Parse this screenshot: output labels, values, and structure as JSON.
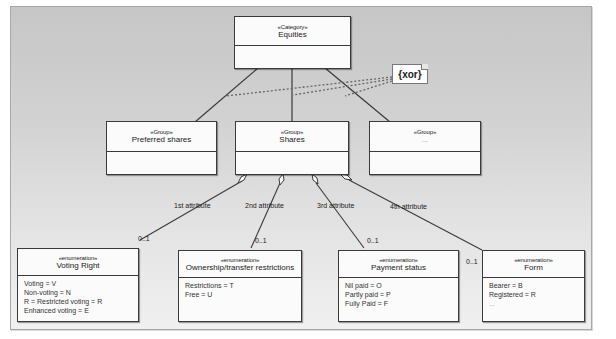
{
  "diagram": {
    "type": "UML class diagram",
    "root": {
      "stereotype": "«Category»",
      "name": "Equities"
    },
    "constraint_note": {
      "text": "{xor}"
    },
    "groups": [
      {
        "stereotype": "«Group»",
        "name": "Preferred shares"
      },
      {
        "stereotype": "«Group»",
        "name": "Shares"
      },
      {
        "stereotype": "«Group»",
        "name": "..."
      }
    ],
    "associations": [
      {
        "role": "1st attribute",
        "multiplicity": "0..1"
      },
      {
        "role": "2nd attribute",
        "multiplicity": "0..1"
      },
      {
        "role": "3rd attribute",
        "multiplicity": "0..1"
      },
      {
        "role": "4th attribute",
        "multiplicity": "0..1"
      }
    ],
    "enumerations": [
      {
        "stereotype": "«enumeration»",
        "name": "Voting Right",
        "literals": [
          "Voting = V",
          "Non-voting = N",
          "R = Restricted voting = R",
          "Enhanced voting = E"
        ]
      },
      {
        "stereotype": "«enumeration»",
        "name": "Ownership/transfer restrictions",
        "literals": [
          "Restrictions = T",
          "Free = U"
        ]
      },
      {
        "stereotype": "«enumeration»",
        "name": "Payment status",
        "literals": [
          "Nil paid = O",
          "Partly paid = P",
          "Fully Paid = F"
        ]
      },
      {
        "stereotype": "«enumeration»",
        "name": "Form",
        "literals": [
          "Bearer = B",
          "Registered = R",
          "..."
        ]
      }
    ]
  },
  "colors": {
    "line": "#3a3a3a",
    "box_fill": "#fbfbfb",
    "canvas_top": "#c6c6c6",
    "canvas_bottom": "#f0f0f0"
  }
}
